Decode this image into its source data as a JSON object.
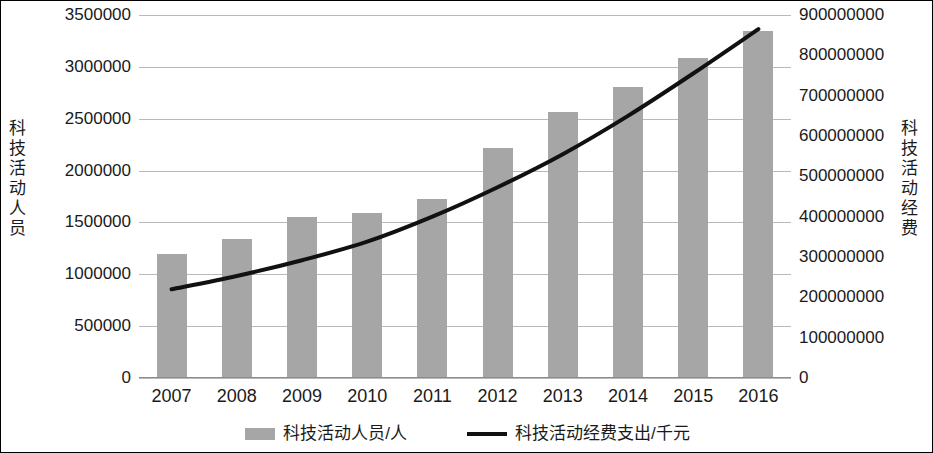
{
  "chart_data": {
    "type": "bar",
    "title": "",
    "subtitle": "",
    "xlabel": "",
    "ylabel": "科技活动人员",
    "y2label": "科技活动经费",
    "grid": true,
    "legend_position": "bottom",
    "categories": [
      "2007",
      "2008",
      "2009",
      "2010",
      "2011",
      "2012",
      "2013",
      "2014",
      "2015",
      "2016"
    ],
    "ylim": [
      0,
      3500000
    ],
    "y_ticks": [
      "0",
      "500000",
      "1000000",
      "1500000",
      "2000000",
      "2500000",
      "3000000",
      "3500000"
    ],
    "y2lim": [
      0,
      900000000
    ],
    "y2_ticks": [
      "0",
      "100000000",
      "200000000",
      "300000000",
      "400000000",
      "500000000",
      "600000000",
      "700000000",
      "800000000",
      "900000000"
    ],
    "series": [
      {
        "name": "科技活动人员/人",
        "type": "bar",
        "axis": "left",
        "color": "#a6a6a6",
        "values": [
          1200000,
          1340000,
          1550000,
          1595000,
          1730000,
          2215000,
          2560000,
          2805000,
          3090000,
          3345000
        ]
      },
      {
        "name": "科技活动经费支出/千元",
        "type": "line",
        "axis": "right",
        "color": "#111111",
        "values": [
          220000000,
          253000000,
          292000000,
          338000000,
          400000000,
          473000000,
          555000000,
          650000000,
          755000000,
          865000000
        ]
      }
    ]
  },
  "legend": {
    "items": [
      {
        "label": "科技活动人员/人",
        "marker": "bar-swatch"
      },
      {
        "label": "科技活动经费支出/千元",
        "marker": "line-swatch"
      }
    ]
  }
}
